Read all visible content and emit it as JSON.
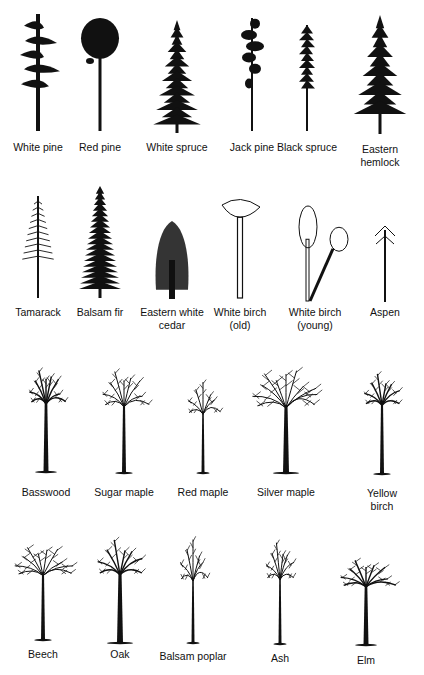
{
  "rows": [
    {
      "name": "conifers-row",
      "trees": [
        {
          "label": "White pine",
          "x": 38,
          "label_y": 141,
          "type": "white-pine",
          "top": 14,
          "base": 131
        },
        {
          "label": "Red pine",
          "x": 100,
          "label_y": 141,
          "type": "red-pine",
          "top": 18,
          "base": 131
        },
        {
          "label": "White spruce",
          "x": 177,
          "label_y": 141,
          "type": "spruce",
          "top": 20,
          "base": 133
        },
        {
          "label": "Jack pine",
          "x": 252,
          "label_y": 141,
          "type": "jack-pine",
          "top": 18,
          "base": 131
        },
        {
          "label": "Black spruce",
          "x": 307,
          "label_y": 141,
          "type": "black-spruce",
          "top": 25,
          "base": 131
        },
        {
          "label": "Eastern\nhemlock",
          "x": 380,
          "label_y": 143,
          "type": "hemlock",
          "top": 15,
          "base": 134
        }
      ]
    },
    {
      "name": "mixed-row",
      "trees": [
        {
          "label": "Tamarack",
          "x": 38,
          "label_y": 306,
          "type": "tamarack",
          "top": 196,
          "base": 298
        },
        {
          "label": "Balsam fir",
          "x": 100,
          "label_y": 306,
          "type": "fir",
          "top": 186,
          "base": 298
        },
        {
          "label": "Eastern white\ncedar",
          "x": 172,
          "label_y": 306,
          "type": "cedar",
          "top": 221,
          "base": 299
        },
        {
          "label": "White birch\n(old)",
          "x": 240,
          "label_y": 306,
          "type": "birch-old",
          "top": 197,
          "base": 298
        },
        {
          "label": "White birch\n(young)",
          "x": 315,
          "label_y": 306,
          "type": "birch-young",
          "top": 206,
          "base": 301
        },
        {
          "label": "Aspen",
          "x": 385,
          "label_y": 306,
          "type": "aspen",
          "top": 222,
          "base": 302
        }
      ]
    },
    {
      "name": "hardwoods-row",
      "trees": [
        {
          "label": "Basswood",
          "x": 46,
          "label_y": 486,
          "type": "basswood",
          "top": 362,
          "base": 472
        },
        {
          "label": "Sugar maple",
          "x": 124,
          "label_y": 486,
          "type": "sugar-maple",
          "top": 366,
          "base": 473
        },
        {
          "label": "Red maple",
          "x": 203,
          "label_y": 486,
          "type": "red-maple",
          "top": 378,
          "base": 473
        },
        {
          "label": "Silver maple",
          "x": 286,
          "label_y": 486,
          "type": "silver-maple",
          "top": 368,
          "base": 473
        },
        {
          "label": "Yellow birch",
          "x": 382,
          "label_y": 487,
          "type": "yellow-birch",
          "top": 363,
          "base": 474
        }
      ]
    },
    {
      "name": "hardwoods-row-2",
      "trees": [
        {
          "label": "Beech",
          "x": 43,
          "label_y": 648,
          "type": "beech",
          "top": 536,
          "base": 640
        },
        {
          "label": "Oak",
          "x": 120,
          "label_y": 648,
          "type": "oak",
          "top": 533,
          "base": 643
        },
        {
          "label": "Balsam poplar",
          "x": 193,
          "label_y": 650,
          "type": "poplar",
          "top": 543,
          "base": 643
        },
        {
          "label": "Ash",
          "x": 280,
          "label_y": 652,
          "type": "ash",
          "top": 540,
          "base": 644
        },
        {
          "label": "Elm",
          "x": 366,
          "label_y": 654,
          "type": "elm",
          "top": 551,
          "base": 645
        }
      ]
    }
  ],
  "colors": {
    "ink": "#111111",
    "background": "#ffffff"
  }
}
